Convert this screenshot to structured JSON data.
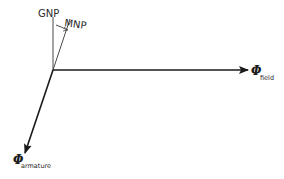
{
  "diagram": {
    "type": "vector-diagram",
    "labels": {
      "gnp": "GNP",
      "mnp": "MNP",
      "field_symbol": "Φ",
      "field_subscript": "field",
      "armature_symbol": "Φ",
      "armature_subscript": "armature"
    },
    "colors": {
      "line": "#1a1a1a",
      "thin_line": "#4a4a4a",
      "background": "#ffffff"
    }
  }
}
